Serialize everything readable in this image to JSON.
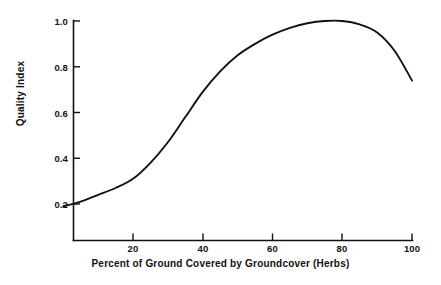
{
  "chart_data": {
    "type": "line",
    "title": "",
    "subtitle": "",
    "xlabel": "Percent of Ground Covered by Groundcover (Herbs)",
    "ylabel": "Quality Index",
    "xlim": [
      0,
      103
    ],
    "ylim": [
      0.0,
      1.04
    ],
    "grid": false,
    "legend": null,
    "legend_position": "none",
    "xticks": [
      20,
      40,
      60,
      80,
      100
    ],
    "xtick_labels": [
      "20",
      "40",
      "60",
      "80",
      "100"
    ],
    "yticks": [
      0.2,
      0.4,
      0.6,
      0.8,
      1.0
    ],
    "ytick_labels": [
      "0.2",
      "0.4",
      "0.6",
      "0.8",
      "1.0"
    ],
    "series": [
      {
        "name": "Quality Index",
        "color": "#111111",
        "x": [
          0,
          5,
          10,
          15,
          20,
          25,
          30,
          35,
          40,
          45,
          50,
          55,
          60,
          65,
          70,
          75,
          80,
          85,
          90,
          95,
          100
        ],
        "y": [
          0.19,
          0.21,
          0.24,
          0.27,
          0.31,
          0.38,
          0.47,
          0.58,
          0.69,
          0.78,
          0.85,
          0.9,
          0.94,
          0.97,
          0.99,
          1.0,
          1.0,
          0.985,
          0.95,
          0.87,
          0.74
        ]
      }
    ],
    "annotations": [],
    "peak": {
      "x": 76,
      "y": 1.0
    },
    "colors": {
      "axis": "#111111",
      "curve": "#111111",
      "background": "#ffffff"
    }
  }
}
